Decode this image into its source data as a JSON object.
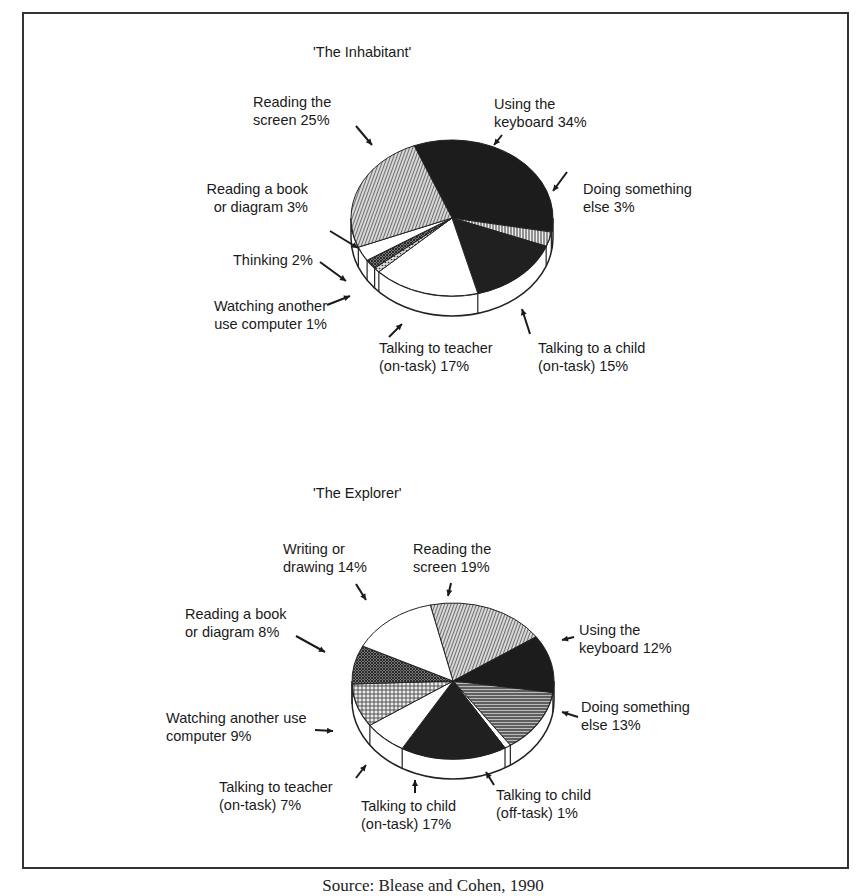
{
  "chart_data": [
    {
      "type": "pie",
      "title": "'The Inhabitant'",
      "style": "3d-exploded-none",
      "slices": [
        {
          "label": "Using the keyboard",
          "value": 34,
          "fill": "#1c1c1c",
          "pattern": "solid-dark"
        },
        {
          "label": "Doing something else",
          "value": 3,
          "fill": "#cfcfcf",
          "pattern": "vertical-lines"
        },
        {
          "label": "Talking to a child (on-task)",
          "value": 15,
          "fill": "#202020",
          "pattern": "solid-dark"
        },
        {
          "label": "Talking to teacher (on-task)",
          "value": 17,
          "fill": "#ffffff",
          "pattern": "none"
        },
        {
          "label": "Watching another use computer",
          "value": 1,
          "fill": "#bbbbbb",
          "pattern": "dots"
        },
        {
          "label": "Thinking",
          "value": 2,
          "fill": "#555555",
          "pattern": "dense-hatch"
        },
        {
          "label": "Reading a book or diagram",
          "value": 3,
          "fill": "#ffffff",
          "pattern": "none"
        },
        {
          "label": "Reading the screen",
          "value": 25,
          "fill": "#9a9a9a",
          "pattern": "diagonal-lines"
        }
      ]
    },
    {
      "type": "pie",
      "title": "'The Explorer'",
      "style": "3d",
      "slices": [
        {
          "label": "Reading the screen",
          "value": 19,
          "fill": "#9a9a9a",
          "pattern": "diagonal-lines"
        },
        {
          "label": "Using the keyboard",
          "value": 12,
          "fill": "#1c1c1c",
          "pattern": "solid-dark"
        },
        {
          "label": "Doing something else",
          "value": 13,
          "fill": "#6e6e6e",
          "pattern": "horizontal-lines"
        },
        {
          "label": "Talking to child (off-task)",
          "value": 1,
          "fill": "#ffffff",
          "pattern": "none"
        },
        {
          "label": "Talking to child (on-task)",
          "value": 17,
          "fill": "#202020",
          "pattern": "solid-dark"
        },
        {
          "label": "Talking to teacher (on-task)",
          "value": 7,
          "fill": "#ffffff",
          "pattern": "none"
        },
        {
          "label": "Watching another use computer",
          "value": 9,
          "fill": "#b5b5b5",
          "pattern": "crosshatch"
        },
        {
          "label": "Reading a book or diagram",
          "value": 8,
          "fill": "#5a5a5a",
          "pattern": "dense-crosshatch"
        },
        {
          "label": "Writing or drawing",
          "value": 14,
          "fill": "#ffffff",
          "pattern": "none"
        }
      ]
    }
  ],
  "charts": {
    "inhabitant": {
      "title": "'The Inhabitant'",
      "labels": {
        "reading_screen": "Reading the\nscreen 25%",
        "keyboard": "Using the\nkeyboard 34%",
        "book": "Reading a book\nor diagram 3%",
        "something_else": "Doing something\nelse 3%",
        "thinking": "Thinking 2%",
        "watching": "Watching another\nuse computer 1%",
        "teacher": "Talking to teacher\n(on-task) 17%",
        "child": "Talking to a child\n(on-task) 15%"
      }
    },
    "explorer": {
      "title": "'The Explorer'",
      "labels": {
        "writing": "Writing or\ndrawing 14%",
        "reading_screen": "Reading the\nscreen 19%",
        "book": "Reading a book\nor diagram 8%",
        "keyboard": "Using the\nkeyboard 12%",
        "watching": "Watching another use\ncomputer 9%",
        "something_else": "Doing something\nelse 13%",
        "teacher": "Talking to teacher\n(on-task) 7%",
        "child_on": "Talking to child\n(on-task) 17%",
        "child_off": "Talking to child\n(off-task) 1%"
      }
    }
  },
  "caption": "Source: Blease and Cohen, 1990"
}
